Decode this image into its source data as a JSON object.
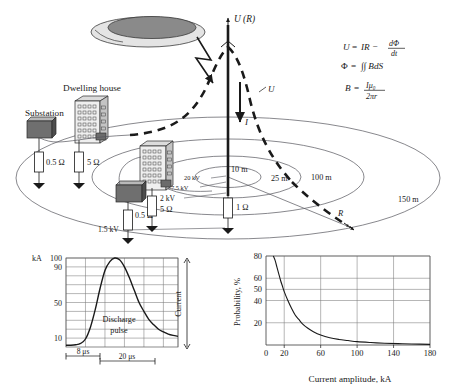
{
  "figure": {
    "background_color": "#ffffff",
    "ink_color": "#1a1a1a",
    "fill_gray": "#8a8a8a",
    "fill_light": "#d9d9d9"
  },
  "diagram": {
    "axis_label_top": "U (R)",
    "label_I": "I",
    "label_U": "U",
    "label_R": "R",
    "cloud_name": "storm-cloud",
    "lightning_name": "lightning-bolt-arrow",
    "buildings": [
      {
        "name": "dwelling-house",
        "label": "Dwelling house"
      },
      {
        "name": "second-house",
        "label": ""
      }
    ],
    "substations": [
      {
        "name": "substation-left",
        "label": "Substation"
      },
      {
        "name": "substation-mid",
        "label": ""
      }
    ],
    "resistors": [
      {
        "name": "resistor-substation-left",
        "label": "0.5 Ω"
      },
      {
        "name": "resistor-house-left",
        "label": "5 Ω"
      },
      {
        "name": "resistor-substation-mid",
        "label": "0.5 Ω"
      },
      {
        "name": "resistor-house-mid",
        "label": "5 Ω"
      },
      {
        "name": "resistor-strike-point",
        "label": "1 Ω"
      }
    ],
    "radius_rings": [
      {
        "name": "ring-10m",
        "label": "10 m"
      },
      {
        "name": "ring-25m",
        "label": "25 m"
      },
      {
        "name": "ring-100m",
        "label": "100 m"
      },
      {
        "name": "ring-150m",
        "label": "150 m"
      }
    ],
    "potential_labels": [
      {
        "name": "potential-20kv",
        "label": "20 kV"
      },
      {
        "name": "potential-7-5kv",
        "label": "7.5 kV"
      },
      {
        "name": "potential-2kv",
        "label": "2 kV"
      },
      {
        "name": "potential-1-5kv",
        "label": "1.5 kV"
      }
    ],
    "formulas": [
      {
        "name": "formula-u",
        "lhs": "U",
        "eq": "=",
        "rhs": "IR −",
        "frac_num": "dΦ",
        "frac_den": "dt"
      },
      {
        "name": "formula-phi",
        "lhs": "Φ",
        "eq": "=",
        "rhs": "∫∫ BdS"
      },
      {
        "name": "formula-b",
        "lhs": "B",
        "eq": "=",
        "frac_num": "Iμ₀",
        "frac_den": "2πr"
      }
    ]
  },
  "chart_data": [
    {
      "name": "discharge-pulse-chart",
      "type": "line",
      "title": "",
      "annotation": "Discharge\npulse",
      "annotation_line1": "Discharge",
      "annotation_line2": "pulse",
      "ylabel": "kA",
      "xlabel": "",
      "right_label": "Current",
      "yticks": [
        10,
        50,
        90,
        100
      ],
      "ytick_labels": [
        "10",
        "50",
        "90",
        "100"
      ],
      "ylim": [
        0,
        100
      ],
      "xlim": [
        0,
        46
      ],
      "grid": true,
      "x_annotations": [
        {
          "name": "front-time",
          "label": "8 μs",
          "from": 8,
          "to": 16
        },
        {
          "name": "tail-time",
          "label": "20 μs",
          "from": 16,
          "to": 30
        }
      ],
      "x": [
        0,
        2,
        4,
        6,
        8,
        10,
        12,
        14,
        16,
        18,
        20,
        22,
        24,
        26,
        28,
        30,
        32,
        34,
        36,
        38,
        40,
        42,
        44,
        46
      ],
      "y": [
        2,
        2,
        2.5,
        4,
        9,
        22,
        42,
        66,
        86,
        96,
        100,
        98,
        90,
        78,
        64,
        50,
        40,
        31,
        25,
        20,
        17,
        14.5,
        13,
        12
      ]
    },
    {
      "name": "current-amplitude-probability-chart",
      "type": "line",
      "title": "",
      "ylabel": "Probability, %",
      "xlabel": "Current amplitude, kA",
      "xticks": [
        0,
        20,
        60,
        100,
        140,
        180
      ],
      "xtick_labels": [
        "0",
        "20",
        "60",
        "100",
        "140",
        "180"
      ],
      "yticks": [
        20,
        40,
        50,
        60,
        80
      ],
      "ytick_labels": [
        "20",
        "40",
        "50",
        "60",
        "80"
      ],
      "xlim": [
        0,
        180
      ],
      "ylim": [
        0,
        80
      ],
      "grid": true,
      "x": [
        8,
        10,
        12,
        14,
        16,
        18,
        20,
        24,
        28,
        32,
        36,
        40,
        46,
        52,
        60,
        70,
        80,
        90,
        100,
        115,
        130,
        145,
        160,
        180
      ],
      "y": [
        80,
        76,
        70,
        64,
        58,
        53,
        48,
        40,
        33,
        27,
        23,
        19,
        15,
        12,
        9,
        6.5,
        5,
        4,
        3,
        2.2,
        1.6,
        1.2,
        0.9,
        0.6
      ]
    }
  ]
}
